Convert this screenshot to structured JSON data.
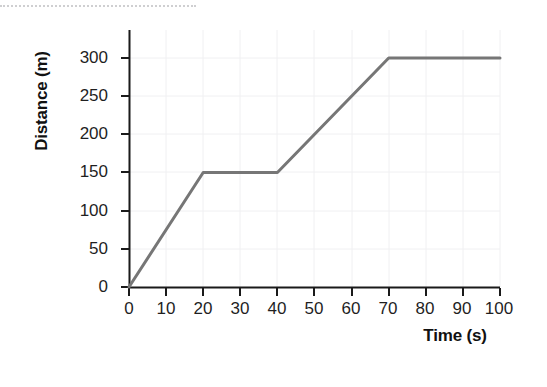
{
  "figure": {
    "background_color": "#ffffff",
    "line_color": "#767676",
    "axis_color": "#1a1a1a",
    "grid_color": "#f0f0f2",
    "top_rule_color": "#cfcfd1"
  },
  "chart_data": {
    "type": "line",
    "title": "",
    "xlabel": "Time (s)",
    "ylabel": "Distance (m)",
    "xlim": [
      0,
      100
    ],
    "ylim": [
      0,
      315
    ],
    "xticks": [
      0,
      10,
      20,
      30,
      40,
      50,
      60,
      70,
      80,
      90,
      100
    ],
    "xtick_labels": [
      "0",
      "10",
      "20",
      "30",
      "40",
      "50",
      "60",
      "70",
      "80",
      "90",
      "100"
    ],
    "yticks": [
      0,
      50,
      100,
      150,
      200,
      250,
      300
    ],
    "ytick_labels": [
      "0",
      "50",
      "100",
      "150",
      "200",
      "250",
      "300"
    ],
    "grid": true,
    "legend": null,
    "series": [
      {
        "name": "distance-time",
        "color": "#767676",
        "x": [
          0,
          20,
          40,
          70,
          100
        ],
        "y": [
          0,
          150,
          150,
          300,
          300
        ]
      }
    ],
    "segments": [
      {
        "from": [
          0,
          0
        ],
        "to": [
          20,
          150
        ],
        "description": "constant speed 7.5 m/s"
      },
      {
        "from": [
          20,
          150
        ],
        "to": [
          40,
          150
        ],
        "description": "stationary"
      },
      {
        "from": [
          40,
          150
        ],
        "to": [
          70,
          300
        ],
        "description": "constant speed 5 m/s"
      },
      {
        "from": [
          70,
          300
        ],
        "to": [
          100,
          300
        ],
        "description": "stationary"
      }
    ]
  }
}
